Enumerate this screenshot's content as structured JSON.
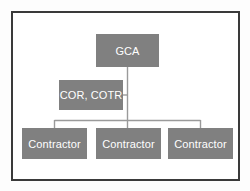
{
  "diagram": {
    "type": "org-chart",
    "frame": {
      "border_color": "#3a3a3a",
      "background_color": "#ffffff"
    },
    "node_style": {
      "fill_color": "#808080",
      "text_color": "#ffffff"
    },
    "connector_color": "#9a9a9a",
    "nodes": {
      "gca": {
        "label": "GCA",
        "level": 1
      },
      "cor_cotr": {
        "label": "COR, COTR",
        "level": 2
      },
      "contractors": [
        {
          "label": "Contractor"
        },
        {
          "label": "Contractor"
        },
        {
          "label": "Contractor"
        }
      ]
    }
  }
}
